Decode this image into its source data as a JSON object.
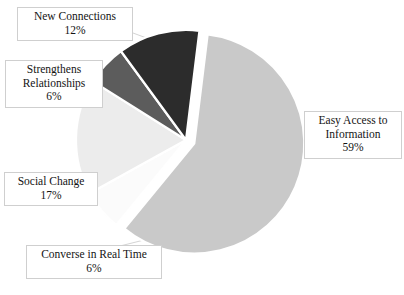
{
  "chart_data": {
    "type": "pie",
    "title": "",
    "subtitle": "",
    "xlabel": "",
    "ylabel": "",
    "legend_position": "callout-labels",
    "grid": false,
    "exploded": true,
    "start_angle_deg": 7,
    "direction": "clockwise",
    "categories": [
      "Easy Access to Information",
      "Converse in Real Time",
      "Social Change",
      "Strengthens Relationships",
      "New Connections"
    ],
    "values": [
      59,
      6,
      17,
      6,
      12
    ],
    "value_labels": [
      "59%",
      "6%",
      "17%",
      "6%",
      "12%"
    ],
    "unit": "%",
    "colors": [
      "#c9c9c9",
      "#fbfbfb",
      "#ececec",
      "#5c5c5c",
      "#2c2c2c"
    ],
    "slices": [
      {
        "name": "easy-access-to-information",
        "label": "Easy Access to Information",
        "label_line_1": "Easy Access to",
        "label_line_2": "Information",
        "value": 59,
        "value_label": "59%",
        "color": "#c9c9c9",
        "exploded": true
      },
      {
        "name": "converse-in-real-time",
        "label": "Converse in Real Time",
        "label_line_1": "Converse in Real Time",
        "label_line_2": "",
        "value": 6,
        "value_label": "6%",
        "color": "#fbfbfb",
        "exploded": false
      },
      {
        "name": "social-change",
        "label": "Social Change",
        "label_line_1": "Social Change",
        "label_line_2": "",
        "value": 17,
        "value_label": "17%",
        "color": "#ececec",
        "exploded": false
      },
      {
        "name": "strengthens-relationships",
        "label": "Strengthens Relationships",
        "label_line_1": "Strengthens",
        "label_line_2": "Relationships",
        "value": 6,
        "value_label": "6%",
        "color": "#5c5c5c",
        "exploded": false
      },
      {
        "name": "new-connections",
        "label": "New Connections",
        "label_line_1": "New Connections",
        "label_line_2": "",
        "value": 12,
        "value_label": "12%",
        "color": "#2c2c2c",
        "exploded": false
      }
    ]
  },
  "callouts": {
    "new_connections": {
      "line1": "New Connections",
      "pct": "12%"
    },
    "strengthens": {
      "line1": "Strengthens",
      "line2": "Relationships",
      "pct": "6%"
    },
    "social_change": {
      "line1": "Social Change",
      "pct": "17%"
    },
    "converse": {
      "line1": "Converse in Real Time",
      "pct": "6%"
    },
    "easy_access": {
      "line1": "Easy Access to",
      "line2": "Information",
      "pct": "59%"
    }
  },
  "style": {
    "background": "#ffffff",
    "callout_border": "#cfcfcf",
    "callout_background": "#ffffff",
    "text_color": "#141414",
    "leader_line_color": "#d2d2d2",
    "slice_separator": "#ffffff"
  }
}
